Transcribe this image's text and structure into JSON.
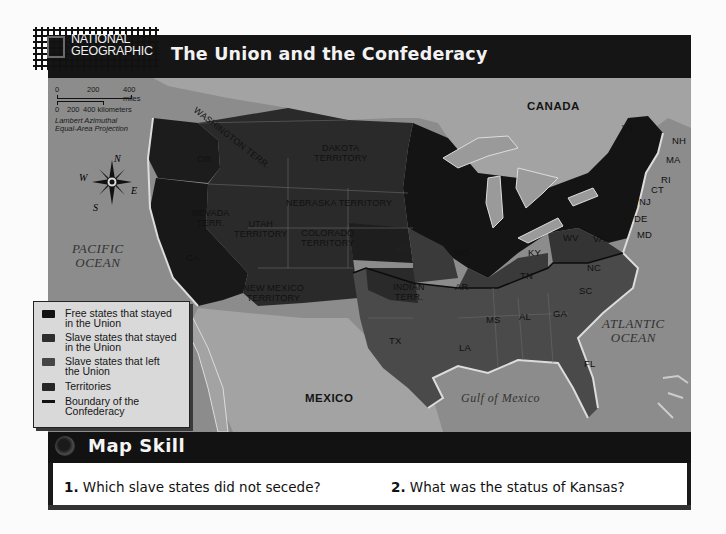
{
  "header": {
    "logo": {
      "line1": "NATIONAL",
      "line2": "GEOGRAPHIC"
    },
    "title": "The Union and the Confederacy"
  },
  "scale_bar": {
    "miles": {
      "ticks": [
        "0",
        "200",
        "400 miles"
      ]
    },
    "kilometers": {
      "ticks": [
        "0",
        "200",
        "400 kilometers"
      ]
    },
    "projection_line1": "Lambert Azimuthal",
    "projection_line2": "Equal-Area Projection"
  },
  "compass": {
    "n": "N",
    "s": "S",
    "e": "E",
    "w": "W"
  },
  "colors": {
    "free_states": "#141414",
    "slave_union": "#3a3a3a",
    "slave_left": "#4a4a4a",
    "territories": "#2c2c2c",
    "water": "#8c8c8c",
    "foreign_land": "#a2a2a2"
  },
  "map_labels": {
    "countries": {
      "canada": "CANADA",
      "mexico": "MEXICO"
    },
    "oceans": {
      "pacific_line1": "PACIFIC",
      "pacific_line2": "OCEAN",
      "atlantic_line1": "ATLANTIC",
      "atlantic_line2": "OCEAN",
      "gulf": "Gulf of Mexico"
    },
    "territories": {
      "washington": "WASHINGTON TERR.",
      "dakota_line1": "DAKOTA",
      "dakota_line2": "TERRITORY",
      "nebraska": "NEBRASKA TERRITORY",
      "nevada_line1": "NEVADA",
      "nevada_line2": "TERR.",
      "utah_line1": "UTAH",
      "utah_line2": "TERRITORY",
      "colorado_line1": "COLORADO",
      "colorado_line2": "TERRITORY",
      "new_mexico_line1": "NEW MEXICO",
      "new_mexico_line2": "TERRITORY",
      "indian_line1": "INDIAN",
      "indian_line2": "TERR."
    },
    "states": {
      "or": "OR",
      "ca": "CA",
      "ks": "KS",
      "mo": "MO",
      "ky": "KY",
      "wv": "WV",
      "va": "VA",
      "md": "MD",
      "de": "DE",
      "nj": "NJ",
      "ct": "CT",
      "ri": "RI",
      "ma": "MA",
      "nh": "NH",
      "vt": "VT",
      "nc": "NC",
      "tn": "TN",
      "ar": "AR",
      "sc": "SC",
      "ms": "MS",
      "al": "AL",
      "ga": "GA",
      "la": "LA",
      "tx": "TX",
      "fl": "FL"
    }
  },
  "legend": {
    "items": [
      {
        "label_line1": "Free states that stayed",
        "label_line2": "in the Union",
        "swatch": "#121212"
      },
      {
        "label_line1": "Slave states that stayed",
        "label_line2": "in the Union",
        "swatch": "#2e2e2e"
      },
      {
        "label_line1": "Slave states that left",
        "label_line2": "the Union",
        "swatch": "#454545"
      },
      {
        "label_line1": "Territories",
        "label_line2": "",
        "swatch": "#262626"
      },
      {
        "label_line1": "Boundary of the",
        "label_line2": "Confederacy",
        "swatch": "line"
      }
    ]
  },
  "map_skill": {
    "title": "Map Skill",
    "questions": [
      {
        "number": "1.",
        "text": "Which slave states did not secede?"
      },
      {
        "number": "2.",
        "text": "What was the status of Kansas?"
      }
    ]
  }
}
